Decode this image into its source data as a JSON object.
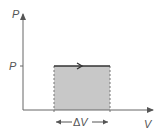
{
  "diagram": {
    "type": "pv-diagram",
    "axes": {
      "y_label": "P",
      "x_label": "V",
      "y_tick_label": "P"
    },
    "process": {
      "description": "isobaric expansion",
      "direction": "right",
      "fill_color": "#c8c8c8",
      "line_color": "#333333"
    },
    "annotation": {
      "delta_prefix": "Δ",
      "delta_var": "V"
    }
  }
}
